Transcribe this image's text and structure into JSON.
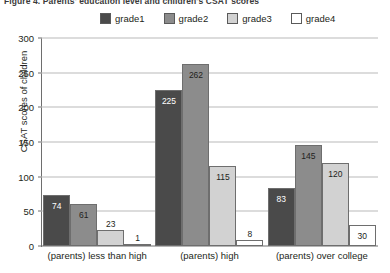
{
  "figure": {
    "title": "Figure 4. Parents' education level and children's CSAT scores"
  },
  "chart_data": {
    "type": "bar",
    "title": "Figure 4. Parents' education level and children's CSAT scores",
    "xlabel": "",
    "ylabel": "CSAT scores of children",
    "ylim": [
      0,
      300
    ],
    "yticks": [
      0,
      50,
      100,
      150,
      200,
      250,
      300
    ],
    "grid": true,
    "legend_position": "top",
    "categories": [
      "(parents) less than high",
      "(parents) high",
      "(parents) over college"
    ],
    "series": [
      {
        "name": "grade1",
        "color": "#4a4a4a",
        "values": [
          74,
          225,
          83
        ]
      },
      {
        "name": "grade2",
        "color": "#8c8c8c",
        "values": [
          61,
          262,
          145
        ]
      },
      {
        "name": "grade3",
        "color": "#d2d2d2",
        "values": [
          23,
          115,
          120
        ]
      },
      {
        "name": "grade4",
        "color": "#ffffff",
        "values": [
          1,
          8,
          30
        ]
      }
    ]
  }
}
